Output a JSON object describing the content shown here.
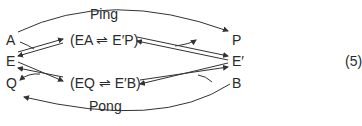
{
  "diagram": {
    "top_label": "Ping",
    "bottom_label": "Pong",
    "nodes": {
      "A": "A",
      "E": "E",
      "Q": "Q",
      "P": "P",
      "E_prime": "E′",
      "B": "B"
    },
    "complex_top": "(EA ⇌ E′P)",
    "complex_bottom": "(EQ ⇌ E′B)",
    "equation_number": "(5)"
  }
}
